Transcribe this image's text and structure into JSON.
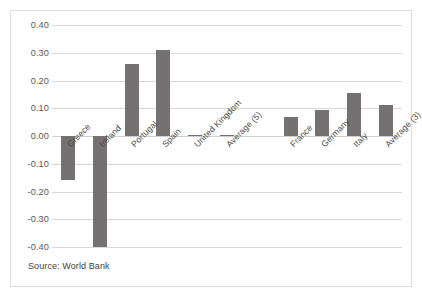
{
  "source_note": "Source: World Bank",
  "chart_data": {
    "type": "bar",
    "title": "",
    "subtitle": "",
    "xlabel": "",
    "ylabel": "",
    "ylim": [
      -0.4,
      0.4
    ],
    "ytick_values": [
      0.4,
      0.3,
      0.2,
      0.1,
      0.0,
      -0.1,
      -0.2,
      -0.3,
      -0.4
    ],
    "ytick_labels": [
      "0.40",
      "0.30",
      "0.20",
      "0.10",
      "0.00",
      "-0.10",
      "-0.20",
      "-0.30",
      "-0.40"
    ],
    "grid": true,
    "legend": "none",
    "bar_color": "#767171",
    "gridline_color": "#d9d9d9",
    "categories": [
      "Greece",
      "Ireland",
      "Portugal",
      "Spain",
      "United Kingdom",
      "Average (5)",
      "",
      "France",
      "Germany",
      "Italy",
      "Average (3)"
    ],
    "values": [
      -0.16,
      -0.4,
      0.26,
      0.31,
      0.005,
      0.004,
      null,
      0.07,
      0.095,
      0.155,
      0.11
    ],
    "series": [
      {
        "name": "Change",
        "values": [
          -0.16,
          -0.4,
          0.26,
          0.31,
          0.005,
          0.004,
          null,
          0.07,
          0.095,
          0.155,
          0.11
        ]
      }
    ]
  }
}
